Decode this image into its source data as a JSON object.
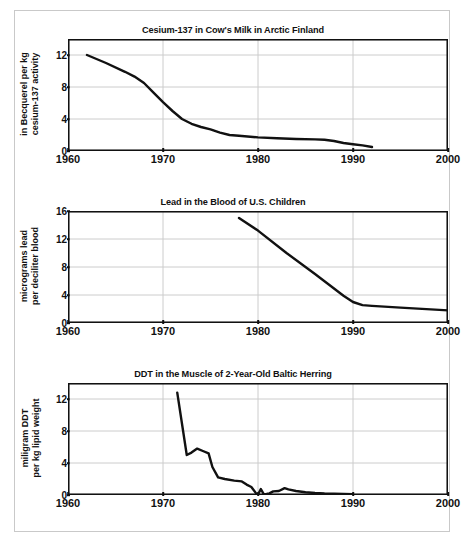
{
  "figure": {
    "caption": "",
    "border_color": "#c9c9c9",
    "line_color": "#111111",
    "grid_color": "#cccccc"
  },
  "axis": {
    "x_min": 1960,
    "x_max": 2000,
    "x_ticks": [
      "1960",
      "1970",
      "1980",
      "1990",
      "2000"
    ],
    "x_tick_values": [
      1960,
      1970,
      1980,
      1990,
      2000
    ],
    "vertical_gridlines": [
      1970,
      1980,
      1990
    ]
  },
  "chart_data": [
    {
      "type": "line",
      "title": "Cesium-137 in Cow's Milk in Arctic Finland",
      "xlabel": "",
      "ylabel": "in Becquerel per kg\ncesium-137 activity",
      "ylabel_line1": "in Becquerel per kg",
      "ylabel_line2": "cesium-137 activity",
      "xlim": [
        1960,
        2000
      ],
      "ylim": [
        0,
        14
      ],
      "yticks": [
        0,
        4,
        8,
        12
      ],
      "ytick_labels": [
        "0",
        "4",
        "8",
        "12"
      ],
      "grid": true,
      "series": [
        {
          "name": "cesium-137 activity",
          "x": [
            1962,
            1964,
            1966,
            1967,
            1968,
            1969,
            1970,
            1971,
            1972,
            1973,
            1974,
            1975,
            1976,
            1977,
            1978,
            1980,
            1982,
            1984,
            1986,
            1987,
            1988,
            1989,
            1990,
            1991,
            1992
          ],
          "y": [
            12.0,
            11.0,
            9.9,
            9.3,
            8.5,
            7.3,
            6.1,
            5.0,
            4.0,
            3.4,
            3.0,
            2.7,
            2.3,
            2.0,
            1.9,
            1.7,
            1.6,
            1.5,
            1.45,
            1.4,
            1.25,
            1.0,
            0.85,
            0.7,
            0.5
          ]
        }
      ]
    },
    {
      "type": "line",
      "title": "Lead in the Blood of U.S. Children",
      "xlabel": "",
      "ylabel": "micrograms lead\nper deciliter blood",
      "ylabel_line1": "micrograms lead",
      "ylabel_line2": "per deciliter blood",
      "xlim": [
        1960,
        2000
      ],
      "ylim": [
        0,
        16
      ],
      "yticks": [
        0,
        4,
        8,
        12,
        16
      ],
      "ytick_labels": [
        "0",
        "4",
        "8",
        "12",
        "16"
      ],
      "grid": true,
      "series": [
        {
          "name": "blood lead level",
          "x": [
            1978,
            1980,
            1983,
            1986,
            1989,
            1990,
            1991,
            1992,
            1995,
            2000
          ],
          "y": [
            15.0,
            13.2,
            10.0,
            7.0,
            3.9,
            3.0,
            2.55,
            2.45,
            2.2,
            1.8
          ]
        }
      ]
    },
    {
      "type": "line",
      "title": "DDT in the Muscle of 2-Year-Old Baltic Herring",
      "xlabel": "",
      "ylabel": "miligram DDT\nper kg lipid weight",
      "ylabel_line1": "miligram DDT",
      "ylabel_line2": "per kg lipid weight",
      "xlim": [
        1960,
        2000
      ],
      "ylim": [
        0,
        14
      ],
      "yticks": [
        0,
        4,
        8,
        12
      ],
      "ytick_labels": [
        "0",
        "4",
        "8",
        "12"
      ],
      "grid": true,
      "series": [
        {
          "name": "DDT concentration",
          "x": [
            1971.5,
            1972.5,
            1973.0,
            1973.6,
            1974.2,
            1974.8,
            1975.2,
            1975.8,
            1976.5,
            1977.5,
            1978.3,
            1978.8,
            1979.3,
            1979.8,
            1980.0,
            1980.3,
            1980.6,
            1980.9,
            1981.2,
            1981.6,
            1982.2,
            1982.8,
            1983.2,
            1984.0,
            1985.0,
            1986.0,
            1987.0,
            1988.0,
            1989.0,
            1990.0
          ],
          "y": [
            12.8,
            5.0,
            5.3,
            5.8,
            5.5,
            5.2,
            3.5,
            2.2,
            2.0,
            1.8,
            1.7,
            1.3,
            1.0,
            0.2,
            0.05,
            0.75,
            0.1,
            0.12,
            0.2,
            0.45,
            0.5,
            0.85,
            0.7,
            0.5,
            0.35,
            0.25,
            0.18,
            0.15,
            0.12,
            0.1
          ]
        }
      ]
    }
  ]
}
